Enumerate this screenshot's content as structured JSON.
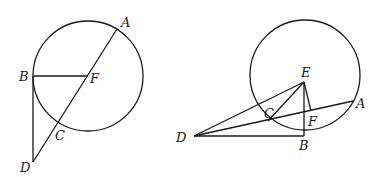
{
  "figures": [
    {
      "id": "left",
      "circle": {
        "cx": 88,
        "cy": 76,
        "r": 55
      },
      "points": {
        "A": {
          "x": 117,
          "y": 29,
          "label": "A",
          "lx": 121,
          "ly": 27
        },
        "B": {
          "x": 33,
          "y": 76,
          "label": "B",
          "lx": 19,
          "ly": 81
        },
        "F": {
          "x": 88,
          "y": 76,
          "label": "F",
          "lx": 90,
          "ly": 83
        },
        "C": {
          "x": 58,
          "y": 124,
          "label": "C",
          "lx": 55,
          "ly": 140
        },
        "D": {
          "x": 33,
          "y": 162,
          "label": "D",
          "lx": 20,
          "ly": 172
        }
      },
      "segments": [
        [
          "A",
          "D"
        ],
        [
          "B",
          "F"
        ],
        [
          "B",
          "D"
        ]
      ]
    },
    {
      "id": "right",
      "circle": {
        "cx": 305,
        "cy": 75,
        "r": 55
      },
      "points": {
        "E": {
          "x": 304,
          "y": 82,
          "label": "E",
          "lx": 301,
          "ly": 77
        },
        "A": {
          "x": 353,
          "y": 101,
          "label": "A",
          "lx": 356,
          "ly": 108
        },
        "B": {
          "x": 304,
          "y": 136,
          "label": "B",
          "lx": 299,
          "ly": 150
        },
        "C": {
          "x": 268,
          "y": 121,
          "label": "C",
          "lx": 264,
          "ly": 118
        },
        "F": {
          "x": 311,
          "y": 111,
          "label": "F",
          "lx": 308,
          "ly": 126
        },
        "D": {
          "x": 194,
          "y": 136,
          "label": "D",
          "lx": 176,
          "ly": 142
        }
      },
      "segments": [
        [
          "D",
          "E"
        ],
        [
          "D",
          "A"
        ],
        [
          "D",
          "B"
        ],
        [
          "E",
          "B"
        ],
        [
          "E",
          "C"
        ],
        [
          "E",
          "F"
        ]
      ]
    }
  ]
}
